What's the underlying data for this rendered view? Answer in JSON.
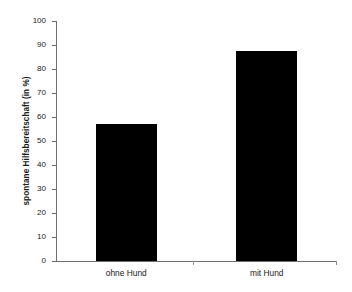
{
  "chart_data": {
    "type": "bar",
    "title": "",
    "subtitle": "",
    "xlabel": "",
    "ylabel": "spontane Hilfsbereitschaft (in %)",
    "categories": [
      "ohne Hund",
      "mit Hund"
    ],
    "values": [
      57,
      87.5
    ],
    "ylim": [
      0,
      100
    ],
    "yticks": [
      0,
      10,
      20,
      30,
      40,
      50,
      60,
      70,
      80,
      90,
      100
    ],
    "ytick_labels": [
      "0",
      "10",
      "20",
      "30",
      "40",
      "50",
      "60",
      "70",
      "80",
      "90",
      "100"
    ],
    "grid": false,
    "legend": null,
    "legend_position": "none",
    "bar_color": "#000000",
    "axis_color": "#6e6e6e",
    "text_color": "#1a1a1a",
    "background": "#ffffff",
    "annotations": []
  }
}
